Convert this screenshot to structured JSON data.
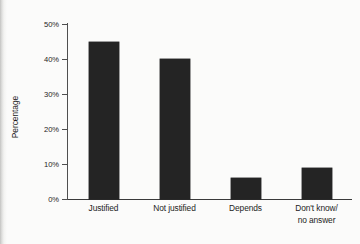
{
  "chart_data": {
    "type": "bar",
    "title": "",
    "subtitle": "",
    "xlabel": "",
    "ylabel": "Percentage",
    "categories": [
      "Justified",
      "Not justified",
      "Depends",
      "Don't know/\nno answer"
    ],
    "category_lines": [
      [
        "Justified"
      ],
      [
        "Not justified"
      ],
      [
        "Depends"
      ],
      [
        "Don't know/",
        "no answer"
      ]
    ],
    "values": [
      45,
      40,
      6,
      9
    ],
    "ylim": [
      0,
      50
    ],
    "yticks": [
      0,
      10,
      20,
      30,
      40,
      50
    ],
    "ytick_labels": [
      "0%",
      "10%",
      "20%",
      "30%",
      "40%",
      "50%"
    ],
    "grid": false,
    "legend": false,
    "legend_position": "none",
    "bar_color": "#242424",
    "background_color": "#fbfbfa",
    "axis_color": "#4f4f4f",
    "text_color": "#1d1d1d"
  }
}
